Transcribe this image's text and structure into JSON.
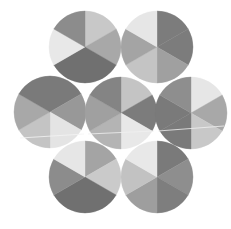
{
  "figure": {
    "width": 231,
    "height": 229,
    "background": "#ffffff",
    "radius": 36,
    "sector_count": 6,
    "sector_order_note": "clockwise starting at 12 o'clock, 60 degrees each",
    "circles": [
      {
        "name": "circle-top-left",
        "cx": 85,
        "cy": 47,
        "sectors": [
          "#c8c8c8",
          "#a8a8a8",
          "#707070",
          "#707070",
          "#e8e8e8",
          "#8c8c8c"
        ]
      },
      {
        "name": "circle-top-right",
        "cx": 157,
        "cy": 47,
        "sectors": [
          "#7c7c7c",
          "#7c7c7c",
          "#a0a0a0",
          "#c4c4c4",
          "#a4a4a4",
          "#e6e6e6"
        ]
      },
      {
        "name": "circle-middle-left",
        "cx": 50,
        "cy": 112,
        "sectors": [
          "#7a7a7a",
          "#989898",
          "#e4e4e4",
          "#c4c4c4",
          "#a8a8a8",
          "#7a7a7a"
        ]
      },
      {
        "name": "circle-center",
        "cx": 121,
        "cy": 113,
        "sectors": [
          "#c4c4c4",
          "#7c7c7c",
          "#e8e8e8",
          "#b4b4b4",
          "#a0a0a0",
          "#848484"
        ]
      },
      {
        "name": "circle-middle-right",
        "cx": 191,
        "cy": 113,
        "sectors": [
          "#e6e6e6",
          "#a8a8a8",
          "#c8c8c8",
          "#7a7a7a",
          "#7a7a7a",
          "#8e8e8e"
        ]
      },
      {
        "name": "circle-bottom-left",
        "cx": 85,
        "cy": 177,
        "sectors": [
          "#a4a4a4",
          "#cacaca",
          "#707070",
          "#707070",
          "#8c8c8c",
          "#e6e6e6"
        ]
      },
      {
        "name": "circle-bottom-right",
        "cx": 157,
        "cy": 177,
        "sectors": [
          "#7a7a7a",
          "#8e8e8e",
          "#7e7e7e",
          "#9e9e9e",
          "#c2c2c2",
          "#e8e8e8"
        ]
      }
    ],
    "artifacts": [
      {
        "name": "scan-line-left",
        "x1": 20,
        "y1": 138,
        "x2": 84,
        "y2": 134,
        "color": "#f4f4f4"
      },
      {
        "name": "scan-line-right",
        "x1": 158,
        "y1": 131,
        "x2": 224,
        "y2": 126,
        "color": "#f0f0f0"
      },
      {
        "name": "scan-line-center",
        "x1": 88,
        "y1": 134,
        "x2": 154,
        "y2": 131,
        "color": "#f0f0f0"
      }
    ]
  }
}
